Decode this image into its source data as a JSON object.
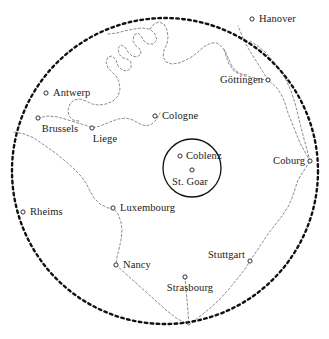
{
  "map": {
    "title": "Regional map centred on St. Goar / Coblenz",
    "width": 329,
    "height": 339,
    "background_color": "#ffffff",
    "ink_color": "#1a1a1a",
    "border_color": "#808080",
    "range_circle": {
      "name": "outer-range-circle",
      "cx": 165,
      "cy": 171,
      "r": 153,
      "style": "heavy-dotted",
      "color": "#111111"
    },
    "inner_circle": {
      "name": "st-goar-coblenz-circle",
      "cx": 192,
      "cy": 168,
      "r": 29,
      "style": "solid",
      "color": "#111111"
    },
    "convergence_point": {
      "x": 189,
      "y": 325
    },
    "cities": [
      {
        "id": "hanover",
        "label": "Hanover",
        "marker_x": 252,
        "marker_y": 19,
        "label_pos": "right",
        "label_x": 259,
        "label_y": 19
      },
      {
        "id": "gottingen",
        "label": "Göttingen",
        "marker_x": 268,
        "marker_y": 80,
        "label_pos": "left",
        "label_x": 263,
        "label_y": 80
      },
      {
        "id": "antwerp",
        "label": "Antwerp",
        "marker_x": 46,
        "marker_y": 93,
        "label_pos": "right",
        "label_x": 53,
        "label_y": 93
      },
      {
        "id": "cologne",
        "label": "Cologne",
        "marker_x": 155,
        "marker_y": 116,
        "label_pos": "right",
        "label_x": 162,
        "label_y": 116
      },
      {
        "id": "brussels",
        "label": "Brussels",
        "marker_x": 38,
        "marker_y": 118,
        "label_pos": "below",
        "label_x": 60,
        "label_y": 124
      },
      {
        "id": "liege",
        "label": "Liege",
        "marker_x": 92,
        "marker_y": 128,
        "label_pos": "below",
        "label_x": 105,
        "label_y": 134
      },
      {
        "id": "coblenz",
        "label": "Coblenz",
        "marker_x": 180,
        "marker_y": 156,
        "label_pos": "right",
        "label_x": 186,
        "label_y": 156
      },
      {
        "id": "coburg",
        "label": "Coburg",
        "marker_x": 310,
        "marker_y": 161,
        "label_pos": "left",
        "label_x": 305,
        "label_y": 161
      },
      {
        "id": "st-goar",
        "label": "St. Goar",
        "marker_x": 192,
        "marker_y": 170,
        "label_pos": "below",
        "label_x": 190,
        "label_y": 177
      },
      {
        "id": "luxembourg",
        "label": "Luxembourg",
        "marker_x": 113,
        "marker_y": 208,
        "label_pos": "right",
        "label_x": 120,
        "label_y": 208
      },
      {
        "id": "rheims",
        "label": "Rheims",
        "marker_x": 23,
        "marker_y": 212,
        "label_pos": "right",
        "label_x": 30,
        "label_y": 212
      },
      {
        "id": "stuttgart",
        "label": "Stuttgart",
        "marker_x": 250,
        "marker_y": 261,
        "label_pos": "left",
        "label_x": 245,
        "label_y": 255
      },
      {
        "id": "nancy",
        "label": "Nancy",
        "marker_x": 116,
        "marker_y": 265,
        "label_pos": "right",
        "label_x": 123,
        "label_y": 265
      },
      {
        "id": "strasbourg",
        "label": "Strasbourg",
        "marker_x": 185,
        "marker_y": 277,
        "label_pos": "below",
        "label_x": 190,
        "label_y": 283
      }
    ],
    "boundaries": [
      {
        "id": "northern-coast-river",
        "name": "northern-winding-boundary",
        "d": "M 108 34 L 117 33 L 124 31 L 134 29 L 142 28 L 150 29 L 155 34 L 157 40 L 153 44 L 148 44 L 144 41 L 141 36 L 138 33 L 134 35 L 133 41 L 136 46 L 140 49 L 141 54 L 137 57 L 132 56 L 128 52 L 125 47 L 121 45 L 118 48 L 119 54 L 123 58 L 127 59 L 131 62 L 131 68 L 127 71 L 122 70 L 118 66 L 116 60 L 112 56 L 108 57 L 106 62 L 108 68 L 112 72 L 116 76 L 119 82 L 120 89 L 118 96 L 113 101 L 106 104 L 99 105 L 92 104 L 86 101 L 80 99 L 74 100 L 70 104 L 68 110 L 69 116 L 73 120 L 79 121"
      },
      {
        "id": "northern-coast-river-b",
        "name": "northern-winding-boundary-east",
        "d": "M 150 29 L 154 24 L 159 22 L 164 24 L 167 30 L 168 37 L 167 44 L 164 50 L 163 57 L 166 62 L 172 64 L 179 63 L 186 60 L 193 56 L 199 51 L 205 46 L 211 43 L 217 43 L 222 47 L 226 53 L 229 60 L 232 66 L 236 71 L 241 74 L 247 75"
      },
      {
        "id": "brussels-liege-link",
        "name": "brussels-liege-connector",
        "d": "M 38 118 L 48 116 L 58 117 L 68 120 L 78 123 L 88 126 L 92 128 L 100 126 L 110 122 L 118 119 L 126 118 L 133 120 L 140 124 L 146 126 L 152 124 L 157 119 L 160 113"
      },
      {
        "id": "western-border",
        "name": "france-belgium-border",
        "d": "M 14 132 L 24 134 L 34 138 L 44 145 L 54 152 L 64 160 L 72 167 L 80 175 L 86 183 L 90 191 L 94 198 L 100 204 L 108 208 L 113 208 L 118 214 L 121 222 L 122 231 L 121 240 L 119 249 L 117 257 L 116 265"
      },
      {
        "id": "nancy-strasbourg-south",
        "name": "southern-border-nancy-strasbourg",
        "d": "M 116 265 L 126 274 L 136 283 L 146 292 L 156 301 L 166 310 L 176 318 L 189 325"
      },
      {
        "id": "strasbourg-to-convergence",
        "name": "strasbourg-convergence-line",
        "d": "M 185 277 L 186 289 L 187 300 L 188 312 L 189 325"
      },
      {
        "id": "stuttgart-convergence",
        "name": "stuttgart-convergence-line",
        "d": "M 189 325 L 199 317 L 209 309 L 219 300 L 229 289 L 238 278 L 245 269 L 250 261"
      },
      {
        "id": "stuttgart-coburg",
        "name": "stuttgart-coburg-border",
        "d": "M 250 261 L 256 252 L 262 243 L 268 234 L 275 225 L 282 216 L 288 207 L 292 198 L 295 189 L 298 180 L 303 172 L 310 161"
      },
      {
        "id": "coburg-gottingen",
        "name": "coburg-gottingen-border",
        "d": "M 310 161 L 305 152 L 300 143 L 296 133 L 292 123 L 288 113 L 285 103 L 281 94 L 276 87 L 268 80"
      },
      {
        "id": "coburg-to-hanover-arc",
        "name": "coburg-northeast-border",
        "d": "M 310 161 L 307 150 L 304 139 L 301 127 L 298 115 L 295 103 L 291 91 L 286 80 L 280 70 L 273 61 L 266 53 L 258 46 L 250 41"
      },
      {
        "id": "gottingen-north",
        "name": "gottingen-north-border",
        "d": "M 268 80 L 263 72 L 258 64 L 253 56 L 248 48 L 244 40 L 241 33 L 238 26"
      },
      {
        "id": "gottingen-west",
        "name": "gottingen-west-border",
        "d": "M 268 80 L 259 79 L 250 77 L 241 75 L 234 71 L 229 64 L 226 56 L 224 48"
      }
    ]
  }
}
